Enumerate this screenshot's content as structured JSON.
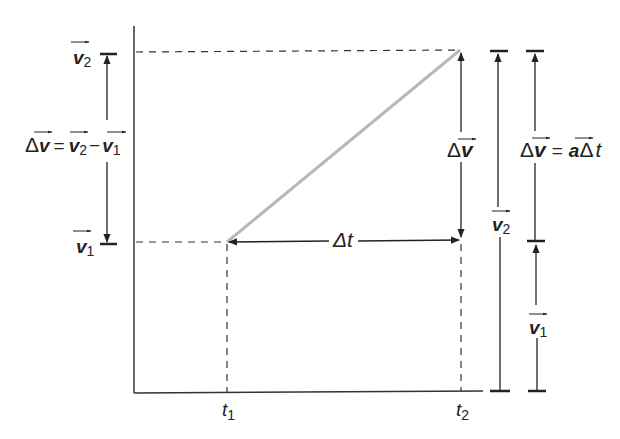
{
  "diagram": {
    "axes": {
      "x_ticks": [
        {
          "symbol": "t",
          "subscript": "1"
        },
        {
          "symbol": "t",
          "subscript": "2"
        }
      ]
    },
    "left_labels": {
      "v2": {
        "symbol": "v",
        "subscript": "2"
      },
      "v1": {
        "symbol": "v",
        "subscript": "1"
      },
      "delta_v_eq": {
        "delta": "Δ",
        "v": "v",
        "equals": "=",
        "v2": "v",
        "v2_sub": "2",
        "minus": "−",
        "v1": "v",
        "v1_sub": "1"
      }
    },
    "graph_labels": {
      "delta_t": {
        "delta": "Δ",
        "t": "t"
      },
      "delta_v": {
        "delta": "Δ",
        "v": "v"
      }
    },
    "right_labels": {
      "v2_bar": {
        "symbol": "v",
        "subscript": "2"
      },
      "v1_bar": {
        "symbol": "v",
        "subscript": "1"
      },
      "delta_v_eq": {
        "delta": "Δ",
        "v": "v",
        "equals": "=",
        "a": "a",
        "delta2": "Δ",
        "t": "t"
      }
    },
    "colors": {
      "line": "#222222",
      "graph_line": "#b8b8b8"
    }
  }
}
